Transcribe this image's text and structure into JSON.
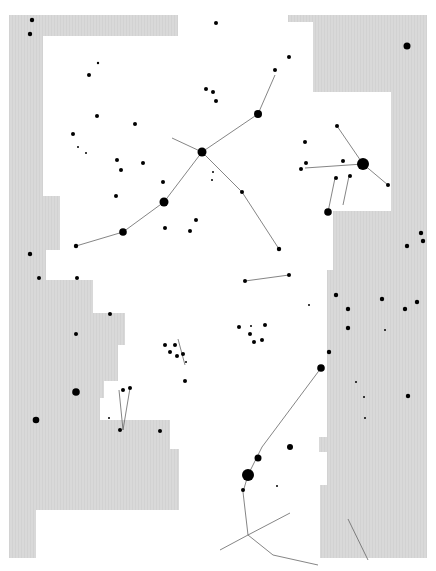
{
  "map": {
    "title": "Summer Triangle star chart",
    "colors": {
      "background": "#ffffff",
      "outside_region": "#d9d9d9",
      "star": "#000000",
      "line": "#555555"
    },
    "constellations": [
      {
        "name": "CEPHEUS",
        "x": 194,
        "y": 31
      },
      {
        "name": "DRACO",
        "x": 344,
        "y": 60
      },
      {
        "name": "LYRA",
        "x": 378,
        "y": 124
      },
      {
        "name": "CYGNUS",
        "x": 273,
        "y": 158
      },
      {
        "name": "HERCULES",
        "x": 382,
        "y": 283
      },
      {
        "name": "VULPECULA",
        "x": 156,
        "y": 288
      },
      {
        "name": "PEGASUS",
        "x": 50,
        "y": 358
      },
      {
        "name": "SAGITTA",
        "x": 235,
        "y": 358
      },
      {
        "name": "DELPHINUS",
        "x": 167,
        "y": 397
      },
      {
        "name": "EQUULEUS",
        "x": 128,
        "y": 443
      },
      {
        "name": "SERPENS",
        "x": 367,
        "y": 443
      },
      {
        "name": "AQUARIUS",
        "x": 96,
        "y": 483
      },
      {
        "name": "AQUILA",
        "x": 212,
        "y": 516
      },
      {
        "name": "SCUTUM",
        "x": 378,
        "y": 516
      }
    ],
    "named_stars": [
      {
        "name": "Deneb",
        "x": 172,
        "y": 138,
        "r": 6
      },
      {
        "name": "Vega",
        "x": 363,
        "y": 164,
        "r": 6
      },
      {
        "name": "Altair",
        "x": 248,
        "y": 475,
        "r": 6
      }
    ],
    "objects": [
      {
        "label": "M39",
        "x": 101,
        "y": 80
      },
      {
        "label": "NGC7000",
        "x": 151,
        "y": 119
      },
      {
        "label": "M29",
        "x": 208,
        "y": 161
      },
      {
        "label": "6940",
        "x": 183,
        "y": 250
      },
      {
        "label": "M56",
        "x": 296,
        "y": 230
      },
      {
        "label": "M57",
        "x": 343,
        "y": 211
      },
      {
        "label": "M27",
        "x": 239,
        "y": 297
      },
      {
        "label": "M71",
        "x": 245,
        "y": 343
      },
      {
        "label": "6934",
        "x": 185,
        "y": 411
      },
      {
        "label": "M11",
        "x": 334,
        "y": 519
      },
      {
        "label": "6712",
        "x": 325,
        "y": 533
      },
      {
        "label": "6664",
        "x": 359,
        "y": 535
      },
      {
        "label": "M26",
        "x": 347,
        "y": 549
      }
    ],
    "variable_stars": [
      "W",
      "SS",
      "U",
      "R",
      "RR",
      "X",
      "P",
      "T",
      "Z",
      "EU",
      "R"
    ],
    "star_labels": {
      "cepheus": [
        "ξ",
        "ε",
        "π¹",
        "π²",
        "ϱ"
      ],
      "cygnus": [
        "α",
        "γ",
        "δ",
        "ε",
        "ζ",
        "η",
        "χ",
        "β",
        "ι",
        "θ",
        "κ",
        "o¹",
        "o²",
        "σ",
        "τ",
        "υ",
        "λ",
        "61",
        "52",
        "41",
        "29",
        "28",
        "μ"
      ],
      "lyra": [
        "α",
        "ε",
        "ζ",
        "δ",
        "γ",
        "β",
        "η",
        "θ",
        "κ"
      ],
      "draco": [
        "γ"
      ],
      "pegasus": [
        "π",
        "ι",
        "κ",
        "ε",
        "θ"
      ],
      "vulpecula": [
        "α",
        "13"
      ],
      "sagitta": [
        "γ",
        "ζ",
        "δ",
        "α",
        "β"
      ],
      "delphinus": [
        "α",
        "β",
        "γ",
        "δ",
        "ε",
        "ζ",
        "η"
      ],
      "equuleus": [
        "α",
        "γ",
        "δ"
      ],
      "aquarius": [
        "α",
        "β",
        "γ",
        "ζ",
        "ε"
      ],
      "aquila": [
        "α",
        "β",
        "γ",
        "δ",
        "ε",
        "ζ",
        "η",
        "θ",
        "ι",
        "λ",
        "μ",
        "12"
      ],
      "scutum": [
        "α",
        "β"
      ],
      "serpens": [
        "θ",
        "η",
        "ν"
      ]
    }
  }
}
